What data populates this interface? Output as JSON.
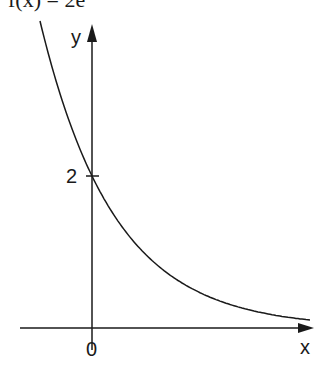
{
  "title": "f(x) = 2e",
  "chart_data": {
    "type": "line",
    "xlabel": "x",
    "ylabel": "y",
    "x_ticks": [
      "0"
    ],
    "y_ticks": [
      "2"
    ],
    "y_intercept": 2,
    "grid": false,
    "series": [
      {
        "name": "f(x)",
        "x": [
          -0.68,
          -0.5,
          0,
          0.5,
          1.0,
          1.5,
          2.0,
          2.87
        ],
        "values": [
          4.04,
          3.37,
          2.0,
          1.19,
          0.71,
          0.42,
          0.25,
          0.11
        ]
      }
    ]
  },
  "labels": {
    "x_axis": "x",
    "y_axis": "y",
    "origin": "0",
    "y_tick": "2"
  }
}
